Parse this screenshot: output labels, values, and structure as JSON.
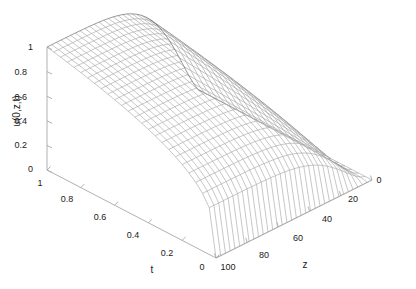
{
  "figure": {
    "background_color": "#ffffff",
    "axis_color": "#a8a8a8",
    "mesh_color": "#8a8a8a",
    "text_color": "#1a1a1a"
  },
  "chart_data": {
    "type": "line",
    "render_style": "3d-mesh-surface",
    "title": "",
    "xlabel": "t",
    "ylabel": "z",
    "zlabel": "u(0,z,t)",
    "grid": false,
    "legend": null,
    "axes": {
      "t": {
        "label": "t",
        "tick_labels": [
          "1",
          "0.8",
          "0.6",
          "0.4",
          "0.2",
          "0"
        ],
        "tick_values": [
          1,
          0.8,
          0.6,
          0.4,
          0.2,
          0
        ],
        "limits": [
          1,
          0
        ],
        "direction": "decreasing-left-to-right"
      },
      "z": {
        "label": "z",
        "tick_labels": [
          "100",
          "80",
          "60",
          "40",
          "20",
          "0"
        ],
        "tick_values": [
          100,
          80,
          60,
          40,
          20,
          0
        ],
        "limits": [
          100,
          0
        ],
        "direction": "decreasing-left-to-right"
      },
      "u": {
        "label": "u(0,z,t)",
        "tick_labels": [
          "0",
          "0.2",
          "0.4",
          "0.6",
          "0.8",
          "1"
        ],
        "tick_values": [
          0,
          0.2,
          0.4,
          0.6,
          0.8,
          1
        ],
        "limits": [
          0,
          1
        ],
        "direction": "increasing-upward"
      }
    },
    "surface": {
      "description": "u(0,z,t) mesh surface, near 1 over most of the domain and falling steeply to 0 as z approaches 0",
      "t_samples": [
        1.0,
        0.9,
        0.8,
        0.7,
        0.6,
        0.5,
        0.4,
        0.3,
        0.2,
        0.1,
        0.0
      ],
      "z_samples": [
        100,
        90,
        80,
        70,
        60,
        50,
        40,
        30,
        20,
        10,
        0
      ],
      "values": [
        [
          1.0,
          1.0,
          1.0,
          1.0,
          1.0,
          0.99,
          0.98,
          0.93,
          0.8,
          0.48,
          0.0
        ],
        [
          1.0,
          1.0,
          1.0,
          1.0,
          1.0,
          0.99,
          0.98,
          0.93,
          0.8,
          0.48,
          0.0
        ],
        [
          1.0,
          1.0,
          1.0,
          1.0,
          0.99,
          0.99,
          0.97,
          0.92,
          0.79,
          0.47,
          0.0
        ],
        [
          0.99,
          0.99,
          0.99,
          0.99,
          0.99,
          0.98,
          0.96,
          0.91,
          0.78,
          0.46,
          0.0
        ],
        [
          0.98,
          0.98,
          0.98,
          0.98,
          0.98,
          0.97,
          0.95,
          0.89,
          0.76,
          0.45,
          0.0
        ],
        [
          0.96,
          0.96,
          0.96,
          0.96,
          0.96,
          0.95,
          0.92,
          0.86,
          0.73,
          0.43,
          0.0
        ],
        [
          0.93,
          0.93,
          0.93,
          0.93,
          0.92,
          0.91,
          0.88,
          0.82,
          0.69,
          0.4,
          0.0
        ],
        [
          0.87,
          0.87,
          0.87,
          0.87,
          0.86,
          0.85,
          0.82,
          0.75,
          0.62,
          0.36,
          0.0
        ],
        [
          0.78,
          0.78,
          0.78,
          0.78,
          0.77,
          0.75,
          0.72,
          0.65,
          0.53,
          0.3,
          0.0
        ],
        [
          0.62,
          0.62,
          0.62,
          0.62,
          0.61,
          0.59,
          0.56,
          0.5,
          0.4,
          0.22,
          0.0
        ],
        [
          0.0,
          0.0,
          0.0,
          0.0,
          0.0,
          0.0,
          0.0,
          0.0,
          0.0,
          0.0,
          0.0
        ]
      ]
    }
  },
  "ticks": {
    "u_axis": [
      {
        "label": "1",
        "x": 33,
        "y": 50
      },
      {
        "label": "0.8",
        "x": 27,
        "y": 75
      },
      {
        "label": "0.6",
        "x": 27,
        "y": 100
      },
      {
        "label": "0.4",
        "x": 27,
        "y": 124
      },
      {
        "label": "0.2",
        "x": 27,
        "y": 148
      },
      {
        "label": "0",
        "x": 33,
        "y": 172
      }
    ],
    "t_axis": [
      {
        "label": "1",
        "x": 40,
        "y": 186
      },
      {
        "label": "0.8",
        "x": 67,
        "y": 202
      },
      {
        "label": "0.6",
        "x": 100,
        "y": 220
      },
      {
        "label": "0.4",
        "x": 133,
        "y": 238
      },
      {
        "label": "0.2",
        "x": 167,
        "y": 256
      },
      {
        "label": "0",
        "x": 202,
        "y": 270
      }
    ],
    "z_axis": [
      {
        "label": "100",
        "x": 228,
        "y": 270
      },
      {
        "label": "80",
        "x": 264,
        "y": 258
      },
      {
        "label": "60",
        "x": 298,
        "y": 241
      },
      {
        "label": "40",
        "x": 327,
        "y": 222
      },
      {
        "label": "20",
        "x": 353,
        "y": 202
      },
      {
        "label": "0",
        "x": 379,
        "y": 183
      }
    ]
  },
  "axis_titles": {
    "t": {
      "text": "t",
      "x": 152,
      "y": 273
    },
    "z": {
      "text": "z",
      "x": 305,
      "y": 268
    },
    "u": {
      "text": "u(0,z,t)",
      "x": 20,
      "y": 111
    }
  }
}
